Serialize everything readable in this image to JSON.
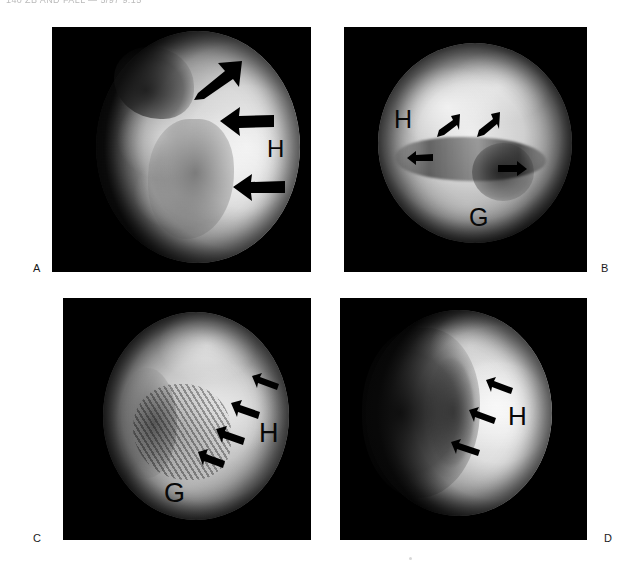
{
  "page": {
    "running_header": "140   ZB AND FALL — 5/97 9:15",
    "background_color": "#ffffff"
  },
  "figure": {
    "caption_letters": [
      "A",
      "B",
      "C",
      "D"
    ],
    "panel_background": "#000000",
    "arrow_color": "#000000",
    "label_color": "#080808",
    "panels": [
      {
        "id": "A",
        "letter": "A",
        "letter_position": "left-of-panel-bottom",
        "anatomy_labels": [
          {
            "text": "H",
            "meaning": "humeral-head"
          }
        ],
        "arrow_count": 3,
        "arrow_style": "thick-block",
        "arrow_directions": [
          "down-left",
          "left",
          "left"
        ]
      },
      {
        "id": "B",
        "letter": "B",
        "letter_position": "right-of-panel-bottom",
        "anatomy_labels": [
          {
            "text": "H",
            "meaning": "humeral-head"
          },
          {
            "text": "G",
            "meaning": "glenoid"
          }
        ],
        "arrow_count": 4,
        "arrow_style": "thin-slender",
        "arrow_directions": [
          "down-left",
          "down-left",
          "right",
          "left"
        ]
      },
      {
        "id": "C",
        "letter": "C",
        "letter_position": "left-of-panel-bottom",
        "anatomy_labels": [
          {
            "text": "H",
            "meaning": "humeral-head"
          },
          {
            "text": "G",
            "meaning": "glenoid"
          }
        ],
        "arrow_count": 4,
        "arrow_style": "thin-slender",
        "arrow_directions": [
          "up-left",
          "up-left",
          "up-left",
          "up-left"
        ]
      },
      {
        "id": "D",
        "letter": "D",
        "letter_position": "right-of-panel-bottom",
        "anatomy_labels": [
          {
            "text": "H",
            "meaning": "humeral-head"
          }
        ],
        "arrow_count": 3,
        "arrow_style": "thin-slender",
        "arrow_directions": [
          "up-left",
          "up-left",
          "up-left"
        ]
      }
    ]
  }
}
